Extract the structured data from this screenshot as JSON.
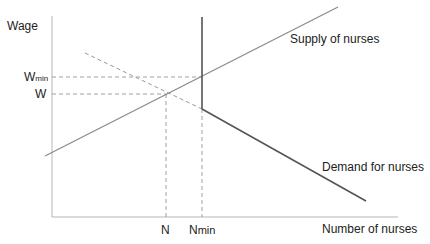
{
  "diagram": {
    "y_axis_label": "Wage",
    "x_axis_label": "Number of nurses",
    "supply_label": "Supply of nurses",
    "demand_label": "Demand for nurses",
    "y_ticks": {
      "w_min_main": "W",
      "w_min_sub": "min",
      "w": "W"
    },
    "x_ticks": {
      "n": "N",
      "n_min_main": "N",
      "n_min_sub": "min"
    },
    "colors": {
      "axis": "#b5b5b5",
      "supply": "#8a8a8a",
      "demand_solid": "#555555",
      "demand_dashed": "#999999",
      "guides": "#a0a0a0",
      "min_wage_vertical": "#555555"
    }
  }
}
